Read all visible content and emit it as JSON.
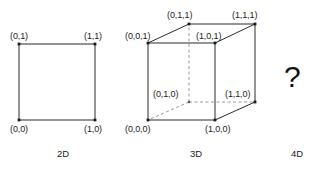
{
  "figure": {
    "title": "",
    "background_color": "#ffffff",
    "stroke_color": "#2b2b2b",
    "dashed_color": "#9a9a9a",
    "text_color": "#1a1a1a"
  },
  "square_2d": {
    "caption": "2D",
    "vertices": [
      {
        "label": "(0,1)",
        "x": 0,
        "y": 1
      },
      {
        "label": "(1,1)",
        "x": 1,
        "y": 1
      },
      {
        "label": "(0,0)",
        "x": 0,
        "y": 0
      },
      {
        "label": "(1,0)",
        "x": 1,
        "y": 0
      }
    ]
  },
  "cube_3d": {
    "caption": "3D",
    "vertices": [
      {
        "label": "(0,0,1)",
        "hidden": false
      },
      {
        "label": "(0,1,1)",
        "hidden": false
      },
      {
        "label": "(1,0,1)",
        "hidden": false
      },
      {
        "label": "(1,1,1)",
        "hidden": false
      },
      {
        "label": "(0,0,0)",
        "hidden": false
      },
      {
        "label": "(0,1,0)",
        "hidden": true
      },
      {
        "label": "(1,0,0)",
        "hidden": false
      },
      {
        "label": "(1,1,0)",
        "hidden": false
      }
    ]
  },
  "unknown_4d": {
    "caption": "4D",
    "glyph": "?"
  }
}
